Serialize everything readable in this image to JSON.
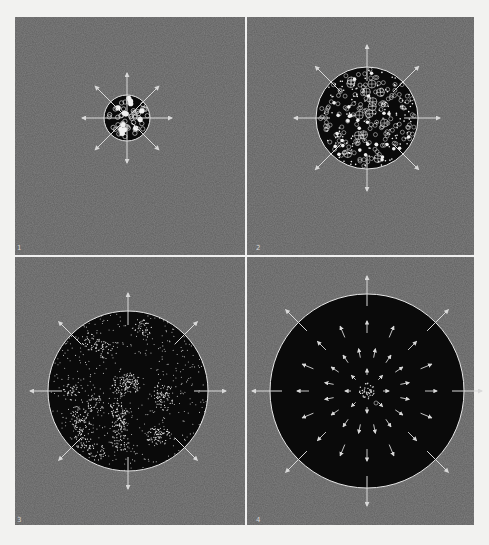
{
  "figure": {
    "title": "",
    "background": "#f2f2f0",
    "frame": {
      "x": 15,
      "y": 17,
      "width": 459,
      "height": 508,
      "fill": "#606060",
      "divider_color": "#f0f0f0",
      "divider_x": 246,
      "divider_y": 256
    },
    "colors": {
      "sphere_fill": "#0a0a0a",
      "outline": "#e6e6e6",
      "arrow": "#d9d9d9",
      "particle": "#f0f0f0"
    },
    "panels": [
      {
        "label": "1",
        "description": "Small dense sphere packed with large particles, arrows radiating outward",
        "cx": 127,
        "cy": 118,
        "r": 23,
        "arrow_len": 22,
        "label_x": 17,
        "label_y": 250,
        "content": "dense-large"
      },
      {
        "label": "2",
        "description": "Larger sphere with crosshair nuclei, rings and dots, arrows radiating outward",
        "cx": 367,
        "cy": 118,
        "r": 51,
        "arrow_len": 22,
        "label_x": 256,
        "label_y": 250,
        "content": "medium-nuclei"
      },
      {
        "label": "3",
        "description": "Larger sphere with clustered fine dots (galaxy-like clumps), arrows radiating outward",
        "cx": 128,
        "cy": 391,
        "r": 80,
        "arrow_len": 18,
        "label_x": 17,
        "label_y": 522,
        "content": "clusters"
      },
      {
        "label": "4",
        "description": "Largest dark sphere, nearly empty with small central cluster, inner arrows showing expansion",
        "cx": 367,
        "cy": 391,
        "r": 97,
        "arrow_len": 18,
        "label_x": 256,
        "label_y": 522,
        "content": "sparse-center"
      }
    ]
  }
}
